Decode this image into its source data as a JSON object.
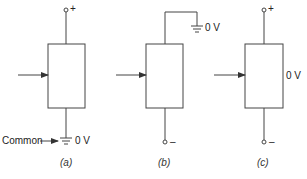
{
  "diagram": {
    "panels": [
      {
        "id": "a",
        "caption": "(a)",
        "top_terminal": "+",
        "bottom_terminal": "ground",
        "ground_label": "0 V",
        "common_label": "Common",
        "input_arrow": true
      },
      {
        "id": "b",
        "caption": "(b)",
        "top_terminal": "ground",
        "ground_label": "0 V",
        "bottom_terminal": "–",
        "input_arrow": true
      },
      {
        "id": "c",
        "caption": "(c)",
        "top_terminal": "+",
        "bottom_terminal": "–",
        "side_label": "0 V",
        "input_arrow": true
      }
    ]
  },
  "labels": {
    "a_plus": "+",
    "a_common": "Common",
    "a_zero": "0 V",
    "a_caption": "(a)",
    "b_zero": "0 V",
    "b_minus": "–",
    "b_caption": "(b)",
    "c_plus": "+",
    "c_zero": "0 V",
    "c_minus": "–",
    "c_caption": "(c)"
  },
  "colors": {
    "stroke": "#333333",
    "text": "#222222"
  }
}
